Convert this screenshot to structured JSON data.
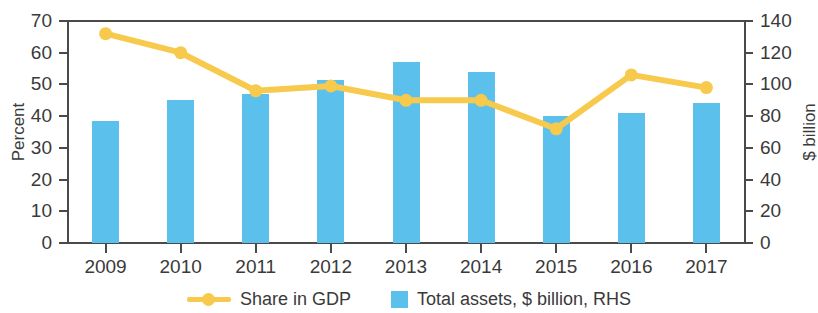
{
  "chart_data": {
    "type": "bar",
    "title": "",
    "categories": [
      "2009",
      "2010",
      "2011",
      "2012",
      "2013",
      "2014",
      "2015",
      "2016",
      "2017"
    ],
    "xlabel": "",
    "ylabel": "Percent",
    "y2label": "$ billion",
    "ylim": [
      0,
      70
    ],
    "y2lim": [
      0,
      140
    ],
    "yticks": [
      0,
      10,
      20,
      30,
      40,
      50,
      60,
      70
    ],
    "y2ticks": [
      0,
      20,
      40,
      60,
      80,
      100,
      120,
      140
    ],
    "grid": false,
    "legend_position": "bottom",
    "series": [
      {
        "name": "Share in GDP",
        "type": "line",
        "axis": "left",
        "unit": "percent",
        "color": "#f7c94c",
        "values": [
          66,
          60,
          48,
          49.5,
          45,
          45,
          36,
          53,
          49
        ]
      },
      {
        "name": "Total assets, $ billion, RHS",
        "type": "bar",
        "axis": "right",
        "unit": "$ billion",
        "color": "#5bc0ec",
        "values": [
          77,
          90,
          94,
          103,
          114,
          108,
          80,
          82,
          88
        ]
      }
    ]
  },
  "axes": {
    "left_title": "Percent",
    "right_title": "$ billion",
    "left_tick_labels": [
      "70",
      "60",
      "50",
      "40",
      "30",
      "20",
      "10",
      "0"
    ],
    "right_tick_labels": [
      "140",
      "120",
      "100",
      "80",
      "60",
      "40",
      "20",
      "0"
    ],
    "x_tick_labels": [
      "2009",
      "2010",
      "2011",
      "2012",
      "2013",
      "2014",
      "2015",
      "2016",
      "2017"
    ]
  },
  "legend": {
    "items": [
      {
        "label": "Share in GDP",
        "marker": "line-with-dot",
        "color": "#f7c94c"
      },
      {
        "label": "Total assets, $ billion, RHS",
        "marker": "square",
        "color": "#5bc0ec"
      }
    ]
  },
  "colors": {
    "bar": "#5bc0ec",
    "line": "#f7c94c",
    "axis": "#4a4a4a",
    "text": "#3a3a3a",
    "background": "#ffffff"
  }
}
